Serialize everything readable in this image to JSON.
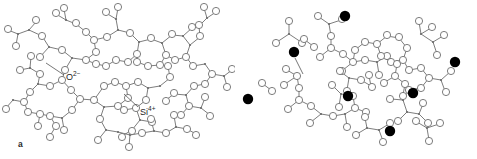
{
  "figure": {
    "background_color": "#ffffff",
    "stroke_color": "#6b6b6b",
    "ion_fill_color": "#000000",
    "oxygen_fill_color": "#ffffff",
    "text_color": "#1e1e1e"
  },
  "panels": [
    {
      "id": "a",
      "caption": "a",
      "name": "silica-glass-network",
      "description": "Continuous random network of silica glass",
      "labels": [
        {
          "id": "oxygen-label",
          "text": "O",
          "charge": "2−",
          "full_text": "O2−",
          "leader_from": [
            64,
            76
          ],
          "leader_to": [
            44,
            62
          ]
        },
        {
          "id": "silicon-label",
          "text": "Si",
          "charge": "4+",
          "full_text": "Si4+",
          "leader_from": [
            139,
            108
          ],
          "leader_to": [
            124,
            95
          ]
        }
      ]
    },
    {
      "id": "b",
      "caption": "b",
      "name": "sodium-silicate-glass-network",
      "description": "Sodium-silicate glass network with modifier cations",
      "labels": [
        {
          "id": "sodium-label",
          "text": "Na",
          "charge": "+",
          "full_text": "Na+",
          "leader_from": [
            306,
            73
          ],
          "leader_to": [
            294,
            57
          ]
        }
      ],
      "sodium_ion_count": 7,
      "sodium_ion_positions": [
        [
          345,
          16
        ],
        [
          294,
          52
        ],
        [
          348,
          96
        ],
        [
          413,
          93
        ],
        [
          248,
          99
        ],
        [
          390,
          131
        ],
        [
          455,
          62
        ]
      ]
    }
  ],
  "legend_keys": [
    {
      "symbol": "open-circle",
      "meaning": "O2− oxygen ion"
    },
    {
      "symbol": "vertex-junction",
      "meaning": "Si4+ silicon ion"
    },
    {
      "symbol": "filled-circle",
      "meaning": "Na+ sodium ion"
    }
  ]
}
